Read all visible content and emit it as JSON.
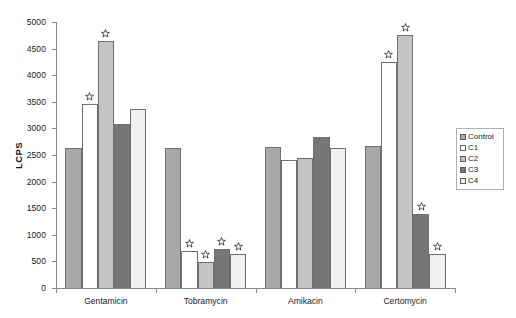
{
  "chart_data": {
    "type": "bar",
    "title": "",
    "subtitle": "",
    "xlabel": "",
    "ylabel": "LCPS",
    "ylim": [
      0,
      5000
    ],
    "yticks": [
      0,
      500,
      1000,
      1500,
      2000,
      2500,
      3000,
      3500,
      4000,
      4500,
      5000
    ],
    "grid": false,
    "legend_position": "right",
    "categories": [
      "Gentamicin",
      "Tobramycin",
      "Amikacin",
      "Certomycin"
    ],
    "series": [
      {
        "name": "Control",
        "color": "#a8a8a8",
        "values": [
          2640,
          2640,
          2650,
          2670
        ]
      },
      {
        "name": "C1",
        "color": "#ffffff",
        "values": [
          3450,
          690,
          2400,
          4250
        ]
      },
      {
        "name": "C2",
        "color": "#c4c4c4",
        "values": [
          4650,
          480,
          2450,
          4760
        ]
      },
      {
        "name": "C3",
        "color": "#767676",
        "values": [
          3080,
          740,
          2830,
          1390
        ]
      },
      {
        "name": "C4",
        "color": "#f0f0f0",
        "values": [
          3370,
          640,
          2640,
          640
        ]
      }
    ],
    "annotations": [
      {
        "text": "star",
        "group": "Gentamicin",
        "series": "C1"
      },
      {
        "text": "star",
        "group": "Gentamicin",
        "series": "C2"
      },
      {
        "text": "star",
        "group": "Tobramycin",
        "series": "C1"
      },
      {
        "text": "star",
        "group": "Tobramycin",
        "series": "C2"
      },
      {
        "text": "star",
        "group": "Tobramycin",
        "series": "C3"
      },
      {
        "text": "star",
        "group": "Tobramycin",
        "series": "C4"
      },
      {
        "text": "star",
        "group": "Certomycin",
        "series": "C1"
      },
      {
        "text": "star",
        "group": "Certomycin",
        "series": "C2"
      },
      {
        "text": "star",
        "group": "Certomycin",
        "series": "C3"
      },
      {
        "text": "star",
        "group": "Certomycin",
        "series": "C4"
      }
    ]
  },
  "axis": {
    "y_title": "LCPS",
    "y_tick_labels": [
      "5000",
      "4500",
      "4000",
      "3500",
      "3000",
      "2500",
      "2000",
      "1500",
      "1000",
      "500",
      "0"
    ],
    "x_tick_labels": [
      "Gentamicin",
      "Tobramycin",
      "Amikacin",
      "Certomycin"
    ]
  },
  "legend": {
    "items": [
      {
        "label": "Control",
        "color": "#a8a8a8"
      },
      {
        "label": "C1",
        "color": "#ffffff"
      },
      {
        "label": "C2",
        "color": "#c4c4c4"
      },
      {
        "label": "C3",
        "color": "#767676"
      },
      {
        "label": "C4",
        "color": "#f0f0f0"
      }
    ]
  }
}
